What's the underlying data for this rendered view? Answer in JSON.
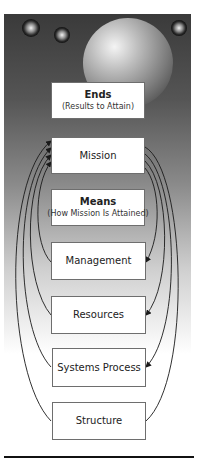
{
  "diagram": {
    "colors": {
      "panel_top": "#3a3a3a",
      "panel_bottom": "#ffffff",
      "box_fill": "#ffffff",
      "box_border": "#6e6e6e",
      "arrow": "#1a1a1a",
      "rule": "#111111"
    },
    "ends": {
      "title": "Ends",
      "subtitle": "(Results to Attain)"
    },
    "mission": {
      "title": "Mission"
    },
    "means": {
      "title": "Means",
      "subtitle": "(How Mission Is Attained)"
    },
    "management": {
      "title": "Management"
    },
    "resources": {
      "title": "Resources"
    },
    "systems_process": {
      "title": "Systems Process"
    },
    "structure": {
      "title": "Structure"
    },
    "decorations": [
      "large-sphere",
      "small-sphere",
      "small-sphere",
      "small-sphere"
    ]
  }
}
